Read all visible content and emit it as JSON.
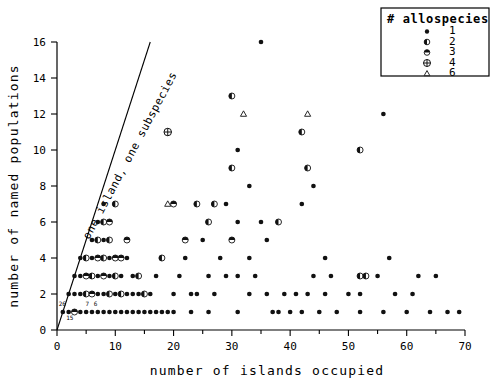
{
  "chart_data": {
    "type": "scatter",
    "title": "",
    "xlabel": "number of islands occupied",
    "ylabel": "number of named populations",
    "xlim": [
      0,
      70
    ],
    "ylim": [
      0,
      16
    ],
    "xticks": [
      0,
      10,
      20,
      30,
      40,
      50,
      60,
      70
    ],
    "xminorticks": [
      5,
      15,
      25,
      35,
      45,
      55,
      65
    ],
    "yticks": [
      0,
      2,
      4,
      6,
      8,
      10,
      12,
      14,
      16
    ],
    "grid": false,
    "legend": {
      "position": "top-right",
      "title": "# allospecies",
      "entries": [
        {
          "label": "1",
          "marker": "filled-dot"
        },
        {
          "label": "2",
          "marker": "half-filled-circle"
        },
        {
          "label": "3",
          "marker": "top-filled-circle"
        },
        {
          "label": "4",
          "marker": "crossed-circle"
        },
        {
          "label": "6",
          "marker": "open-triangle"
        }
      ]
    },
    "annotations": [
      {
        "text": "one island, one subspecies",
        "rotation": -62,
        "x": 5.5,
        "y": 5.0
      }
    ],
    "reference_line": {
      "slope": 1,
      "intercept": 0,
      "note": "one island, one subspecies"
    },
    "overplot_counts": [
      {
        "text": "26",
        "x": 0.9,
        "y": 1.35
      },
      {
        "text": "15",
        "x": 2.2,
        "y": 0.55
      },
      {
        "text": "7",
        "x": 5.2,
        "y": 1.35
      },
      {
        "text": "6",
        "x": 6.6,
        "y": 1.35
      }
    ],
    "series": [
      {
        "name": "1",
        "marker": "filled-dot",
        "points": [
          [
            1,
            1
          ],
          [
            2,
            1
          ],
          [
            3,
            1
          ],
          [
            4,
            1
          ],
          [
            5,
            1
          ],
          [
            6,
            1
          ],
          [
            7,
            1
          ],
          [
            8,
            1
          ],
          [
            9,
            1
          ],
          [
            10,
            1
          ],
          [
            11,
            1
          ],
          [
            12,
            1
          ],
          [
            13,
            1
          ],
          [
            14,
            1
          ],
          [
            15,
            1
          ],
          [
            16,
            1
          ],
          [
            17,
            1
          ],
          [
            18,
            1
          ],
          [
            19,
            1
          ],
          [
            20,
            1
          ],
          [
            23,
            1
          ],
          [
            26,
            1
          ],
          [
            31,
            1
          ],
          [
            37,
            1
          ],
          [
            38,
            1
          ],
          [
            40,
            1
          ],
          [
            42,
            1
          ],
          [
            45,
            1
          ],
          [
            48,
            1
          ],
          [
            52,
            1
          ],
          [
            56,
            1
          ],
          [
            60,
            1
          ],
          [
            64,
            1
          ],
          [
            67,
            1
          ],
          [
            69,
            1
          ],
          [
            2,
            2
          ],
          [
            3,
            2
          ],
          [
            4,
            2
          ],
          [
            5,
            2
          ],
          [
            6,
            2
          ],
          [
            7,
            2
          ],
          [
            8,
            2
          ],
          [
            9,
            2
          ],
          [
            10,
            2
          ],
          [
            12,
            2
          ],
          [
            13,
            2
          ],
          [
            14,
            2
          ],
          [
            16,
            2
          ],
          [
            20,
            2
          ],
          [
            23,
            2
          ],
          [
            24,
            2
          ],
          [
            27,
            2
          ],
          [
            33,
            2
          ],
          [
            36,
            2
          ],
          [
            39,
            2
          ],
          [
            41,
            2
          ],
          [
            43,
            2
          ],
          [
            46,
            2
          ],
          [
            50,
            2
          ],
          [
            52,
            2
          ],
          [
            58,
            2
          ],
          [
            61,
            2
          ],
          [
            3,
            3
          ],
          [
            4,
            3
          ],
          [
            5,
            3
          ],
          [
            6,
            3
          ],
          [
            7,
            3
          ],
          [
            8,
            3
          ],
          [
            9,
            3
          ],
          [
            11,
            3
          ],
          [
            13,
            3
          ],
          [
            17,
            3
          ],
          [
            21,
            3
          ],
          [
            26,
            3
          ],
          [
            29,
            3
          ],
          [
            31,
            3
          ],
          [
            34,
            3
          ],
          [
            44,
            3
          ],
          [
            47,
            3
          ],
          [
            55,
            3
          ],
          [
            62,
            3
          ],
          [
            65,
            3
          ],
          [
            4,
            4
          ],
          [
            5,
            4
          ],
          [
            6,
            4
          ],
          [
            7,
            4
          ],
          [
            9,
            4
          ],
          [
            12,
            4
          ],
          [
            22,
            4
          ],
          [
            28,
            4
          ],
          [
            33,
            4
          ],
          [
            46,
            4
          ],
          [
            57,
            4
          ],
          [
            6,
            5
          ],
          [
            7,
            5
          ],
          [
            8,
            5
          ],
          [
            25,
            5
          ],
          [
            30,
            5
          ],
          [
            36,
            5
          ],
          [
            7,
            6
          ],
          [
            9,
            6
          ],
          [
            26,
            6
          ],
          [
            31,
            6
          ],
          [
            35,
            6
          ],
          [
            8,
            7
          ],
          [
            29,
            7
          ],
          [
            42,
            7
          ],
          [
            33,
            8
          ],
          [
            44,
            8
          ],
          [
            31,
            10
          ],
          [
            56,
            12
          ],
          [
            35,
            16
          ]
        ]
      },
      {
        "name": "2",
        "marker": "half-filled-circle",
        "points": [
          [
            5,
            2
          ],
          [
            9,
            2
          ],
          [
            11,
            2
          ],
          [
            15,
            2
          ],
          [
            6,
            3
          ],
          [
            10,
            3
          ],
          [
            14,
            3
          ],
          [
            52,
            3
          ],
          [
            53,
            3
          ],
          [
            5,
            4
          ],
          [
            8,
            4
          ],
          [
            18,
            4
          ],
          [
            7,
            5
          ],
          [
            9,
            5
          ],
          [
            8,
            6
          ],
          [
            26,
            6
          ],
          [
            38,
            6
          ],
          [
            10,
            7
          ],
          [
            24,
            7
          ],
          [
            27,
            7
          ],
          [
            30,
            9
          ],
          [
            43,
            9
          ],
          [
            52,
            10
          ],
          [
            42,
            11
          ],
          [
            30,
            13
          ]
        ]
      },
      {
        "name": "3",
        "marker": "top-filled-circle",
        "points": [
          [
            3,
            1
          ],
          [
            6,
            2
          ],
          [
            8,
            3
          ],
          [
            10,
            4
          ],
          [
            5,
            3
          ],
          [
            7,
            4
          ],
          [
            12,
            5
          ],
          [
            22,
            5
          ],
          [
            30,
            5
          ],
          [
            9,
            6
          ],
          [
            20,
            7
          ],
          [
            11,
            4
          ]
        ]
      },
      {
        "name": "4",
        "marker": "crossed-circle",
        "points": [
          [
            19,
            11
          ]
        ]
      },
      {
        "name": "6",
        "marker": "open-triangle",
        "points": [
          [
            19,
            7
          ],
          [
            32,
            12
          ],
          [
            43,
            12
          ]
        ]
      }
    ]
  },
  "axes": {
    "x_title": "number of islands occupied",
    "y_title": "number of named populations"
  }
}
